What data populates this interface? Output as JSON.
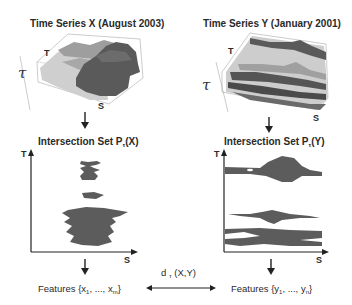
{
  "panels": {
    "x": {
      "title": "Time Series X (August 2003)",
      "surface_axes": {
        "t": "T",
        "tau": "τ",
        "s": "S"
      },
      "intersection_title_prefix": "Intersection Set P",
      "intersection_title_sub": "τ",
      "intersection_title_suffix": "(X)",
      "plot_axes": {
        "y": "T",
        "x": "S"
      },
      "features_prefix": "Features {x",
      "features_sub1": "1",
      "features_mid": ", ..., x",
      "features_sub2": "m",
      "features_suffix": "}"
    },
    "y": {
      "title": "Time Series Y (January 2001)",
      "surface_axes": {
        "t": "T",
        "tau": "τ",
        "s": "S"
      },
      "intersection_title_prefix": "Intersection Set P",
      "intersection_title_sub": "τ",
      "intersection_title_suffix": "(Y)",
      "plot_axes": {
        "y": "T",
        "x": "S"
      },
      "features_prefix": "Features {y",
      "features_sub1": "1",
      "features_mid": ", ..., y",
      "features_sub2": "n",
      "features_suffix": "}"
    }
  },
  "distance": {
    "prefix": "d",
    "sub": "τ",
    "suffix": " (X,Y)"
  },
  "colors": {
    "surface_light": "#c8c8c8",
    "surface_mid": "#9a9a9a",
    "surface_dark": "#5a5a5a",
    "region_fill": "#5c5c5c",
    "axis": "#222222"
  }
}
